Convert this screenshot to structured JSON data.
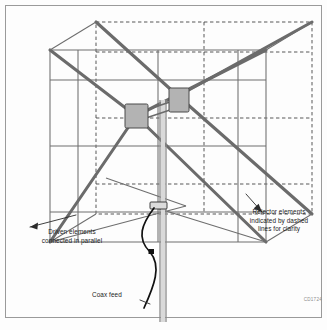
{
  "figure": {
    "code": "CD1724",
    "border_color": "#9a9a9a",
    "background": "#fdfdfd"
  },
  "labels": {
    "driven": "Driven elements\nconnected in parallel",
    "reflector": "Relector elements\nindicated by dashed\nlines for clarity",
    "coax": "Coax feed"
  },
  "colors": {
    "element_solid": "#6e6e6e",
    "spoke": "#6b6b6b",
    "reflector_dashed": "#3a3a3a",
    "hub_block": "#b3b3b3",
    "hub_stroke": "#4a4a4a",
    "mast": "#8a8a8a",
    "coax": "#111111",
    "text": "#1c1c1c"
  },
  "structure": {
    "type": "antenna-diagram",
    "description": "Two-by-two quad array of driven loop elements fed in parallel, with a dashed reflector screen offset behind, mounted on a vertical mast with coax feed",
    "driven_elements": 4,
    "reflector_offset": {
      "dx": 46,
      "dy": -28
    },
    "hub_blocks": 3,
    "mast": {
      "x": 163,
      "top": 112,
      "bottom": 322
    }
  }
}
